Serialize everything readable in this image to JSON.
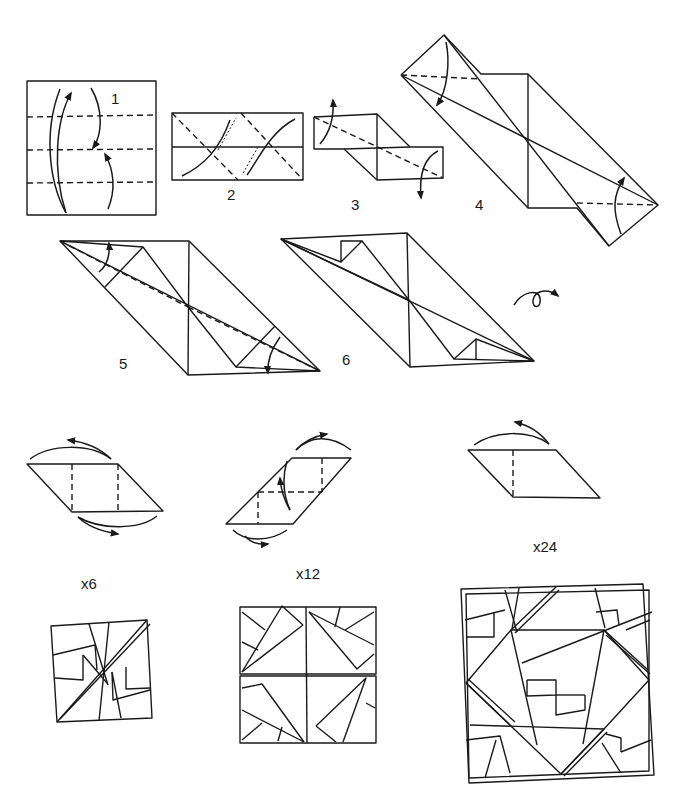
{
  "diagram": {
    "type": "origami folding instructions",
    "steps": [
      {
        "id": "step-1",
        "label": "1"
      },
      {
        "id": "step-2",
        "label": "2"
      },
      {
        "id": "step-3",
        "label": "3"
      },
      {
        "id": "step-4",
        "label": "4"
      },
      {
        "id": "step-5",
        "label": "5"
      },
      {
        "id": "step-6",
        "label": "6"
      }
    ],
    "assembly": [
      {
        "id": "assembly-6",
        "label": "x6"
      },
      {
        "id": "assembly-12",
        "label": "x12"
      },
      {
        "id": "assembly-24",
        "label": "x24"
      }
    ],
    "symbols": {
      "turn_over": "turn-over-icon",
      "valley_fold": "dashed-line",
      "fold_arrow": "curved-arrow"
    },
    "colors": {
      "ink": "#1a1a1a",
      "paper": "#ffffff"
    }
  }
}
